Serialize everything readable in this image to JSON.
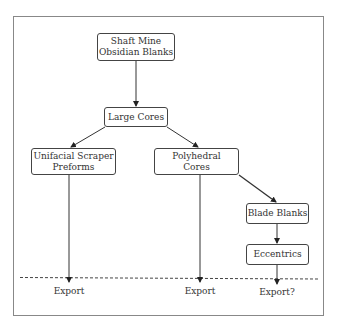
{
  "diagram": {
    "type": "flowchart",
    "nodes": [
      {
        "id": "shaft",
        "label": "Shaft Mine\nObsidian Blanks"
      },
      {
        "id": "large",
        "label": "Large Cores"
      },
      {
        "id": "unifacial",
        "label": "Unifacial Scraper\nPreforms"
      },
      {
        "id": "polyhedral",
        "label": "Polyhedral\nCores"
      },
      {
        "id": "blade",
        "label": "Blade Blanks"
      },
      {
        "id": "eccentrics",
        "label": "Eccentrics"
      }
    ],
    "edges": [
      {
        "from": "shaft",
        "to": "large"
      },
      {
        "from": "large",
        "to": "unifacial"
      },
      {
        "from": "large",
        "to": "polyhedral"
      },
      {
        "from": "polyhedral",
        "to": "blade"
      },
      {
        "from": "blade",
        "to": "eccentrics"
      },
      {
        "from": "unifacial",
        "to": "export1"
      },
      {
        "from": "polyhedral",
        "to": "export2"
      },
      {
        "from": "eccentrics",
        "to": "export3"
      }
    ],
    "outputs": [
      {
        "id": "export1",
        "label": "Export"
      },
      {
        "id": "export2",
        "label": "Export"
      },
      {
        "id": "export3",
        "label": "Export?"
      }
    ],
    "colors": {
      "line": "#333333",
      "frame": "#777777",
      "text": "#333333"
    }
  }
}
